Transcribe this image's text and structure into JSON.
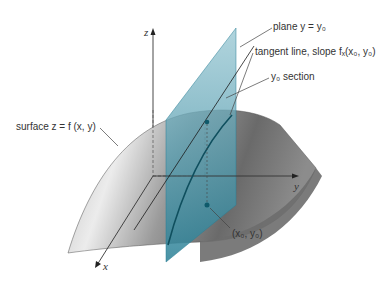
{
  "diagram": {
    "axes": {
      "z_label": "z",
      "y_label": "y",
      "x_label": "x"
    },
    "annotations": {
      "plane": "plane y = y₀",
      "tangent_line": "tangent line, slope fₓ(x₀, y₀)",
      "section": "y₀ section",
      "surface": "surface z = f (x, y)",
      "point": "(x₀, y₀)"
    },
    "colors": {
      "plane": "#2f8aa0",
      "curve": "#0f4f5e",
      "surface_light": "#e6e6e6",
      "surface_dark": "#5e5e5e",
      "axis": "#333333"
    }
  }
}
